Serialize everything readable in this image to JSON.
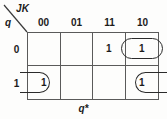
{
  "figure": {
    "caption": "q*",
    "axis_corner": {
      "column_variable": "JK",
      "row_variable": "q"
    }
  },
  "kmap": {
    "column_headers": [
      "00",
      "01",
      "11",
      "10"
    ],
    "row_headers": [
      "0",
      "1"
    ],
    "cells": [
      {
        "row": "0",
        "col": "00",
        "value": ""
      },
      {
        "row": "0",
        "col": "01",
        "value": ""
      },
      {
        "row": "0",
        "col": "11",
        "value": "1"
      },
      {
        "row": "0",
        "col": "10",
        "value": "1"
      },
      {
        "row": "1",
        "col": "00",
        "value": "1"
      },
      {
        "row": "1",
        "col": "01",
        "value": ""
      },
      {
        "row": "1",
        "col": "11",
        "value": ""
      },
      {
        "row": "1",
        "col": "10",
        "value": "1"
      }
    ],
    "groups": [
      {
        "name": "top-pair",
        "cells": [
          "0-11",
          "0-10"
        ],
        "wraps": false
      },
      {
        "name": "wrap-left",
        "cells": [
          "1-00"
        ],
        "wraps": true
      },
      {
        "name": "wrap-right",
        "cells": [
          "1-10"
        ],
        "wraps": true
      }
    ]
  },
  "colors": {
    "ink": "#1b1b1b",
    "grid_line": "#5a5a5a",
    "group_outline": "#2b2b2b",
    "background": "#fdfdfc"
  }
}
